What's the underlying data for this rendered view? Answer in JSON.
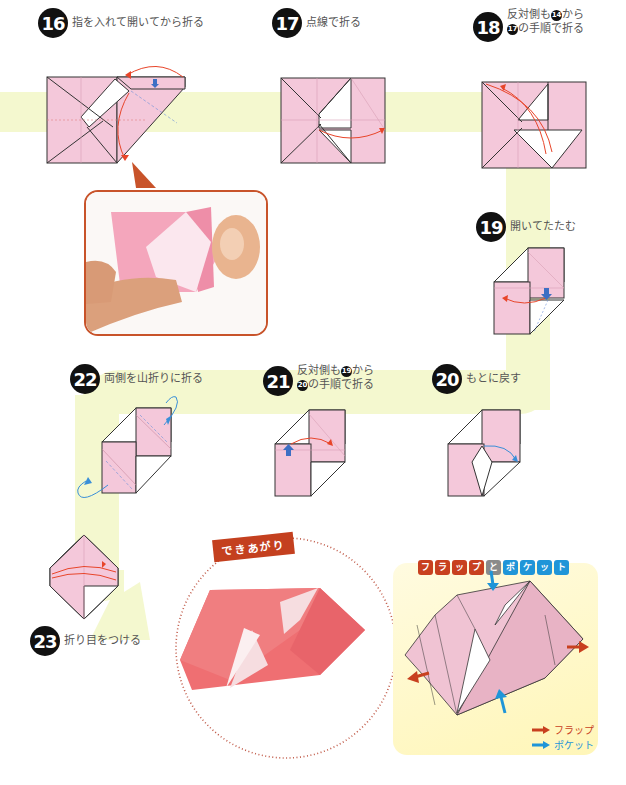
{
  "steps": [
    {
      "num": "16",
      "text": "指を入れて開いてから折る"
    },
    {
      "num": "17",
      "text": "点線で折る"
    },
    {
      "num": "18",
      "line1_pre": "反対側も",
      "line1_ref": "14",
      "line1_post": "から",
      "line2_ref": "17",
      "line2_post": "の手順で折る"
    },
    {
      "num": "19",
      "text": "開いてたたむ"
    },
    {
      "num": "20",
      "text": "もとに戻す"
    },
    {
      "num": "21",
      "line1_pre": "反対側も",
      "line1_ref": "19",
      "line1_post": "から",
      "line2_ref": "20",
      "line2_post": "の手順で折る"
    },
    {
      "num": "22",
      "text": "両側を山折りに折る"
    },
    {
      "num": "23",
      "text": "折り目をつける"
    }
  ],
  "finished": {
    "tag": "できあがり"
  },
  "flap_pocket": {
    "title_tiles_flap": [
      "フ",
      "ラ",
      "ッ",
      "プ"
    ],
    "title_tile_and": "と",
    "title_tiles_pocket": [
      "ポ",
      "ケ",
      "ッ",
      "ト"
    ],
    "legend": [
      {
        "label": "フラップ",
        "color": "#c8401f"
      },
      {
        "label": "ポケット",
        "color": "#1f95d8"
      }
    ]
  },
  "colors": {
    "paper_pink": "#f4c8da",
    "band": "#f4f8cf",
    "arrow_red": "#e8452a",
    "arrow_blue": "#3a8fd8",
    "push_blue": "#3d6fc4",
    "callout": "#c8532a",
    "tile_red": "#c8401f",
    "tile_gray": "#8a8a8a",
    "tile_blue": "#1f95d8"
  }
}
